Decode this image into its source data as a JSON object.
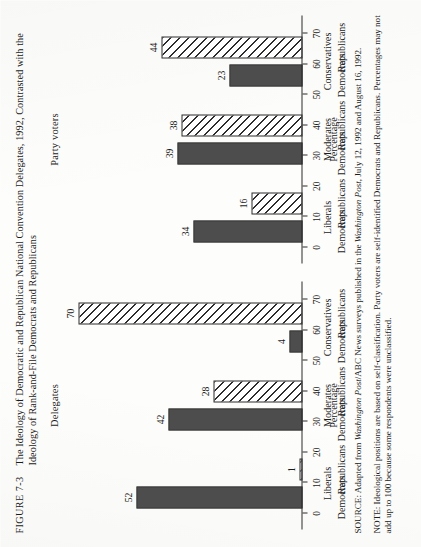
{
  "figure": {
    "number_label": "FIGURE 7-3",
    "caption": "The Ideology of Democratic and Republican National Convention Delegates, 1992, Contrasted with the Ideology of Rank-and-File Democrats and Republicans"
  },
  "footer": {
    "source_label": "SOURCE:",
    "source_part1": " Adapted from ",
    "source_italic1": "Washington Post",
    "source_part2": "/ABC News surveys published in the ",
    "source_italic2": "Washington Post",
    "source_part3": ", July 12, 1992 and August 16, 1992.",
    "note_label": "NOTE:",
    "note_text": " Ideological positions are based on self-classification. Party voters are self-identified Democrats and Republicans. Percentages may not add up to 100 because some respondents were unclassified."
  },
  "axis": {
    "title": "Percentage",
    "ticks": [
      0,
      10,
      20,
      30,
      40,
      50,
      60,
      70
    ],
    "min": 0,
    "max": 72
  },
  "legend": {
    "democrats_label": "Democrats",
    "republicans_label": "Republicans",
    "democrats_fill": "#4d4d4d",
    "republicans_fill": "hatched"
  },
  "chart_data": {
    "type": "bar",
    "title": "The Ideology of Democratic and Republican National Convention Delegates, 1992, Contrasted with the Ideology of Rank-and-File Democrats and Republicans",
    "xlabel": "",
    "ylabel": "Percentage",
    "ylim": [
      0,
      72
    ],
    "grid": false,
    "legend_position": "inline-category-labels",
    "panels": [
      {
        "name": "Delegates",
        "categories": [
          "Liberals",
          "Moderates",
          "Conservatives"
        ],
        "series": [
          {
            "name": "Democrats",
            "style": "solid",
            "values": [
              52,
              42,
              4
            ]
          },
          {
            "name": "Republicans",
            "style": "hatched",
            "values": [
              1,
              28,
              70
            ]
          }
        ]
      },
      {
        "name": "Party voters",
        "categories": [
          "Liberals",
          "Moderates",
          "Conservatives"
        ],
        "series": [
          {
            "name": "Democrats",
            "style": "solid",
            "values": [
              34,
              39,
              23
            ]
          },
          {
            "name": "Republicans",
            "style": "hatched",
            "values": [
              16,
              38,
              44
            ]
          }
        ]
      }
    ]
  }
}
